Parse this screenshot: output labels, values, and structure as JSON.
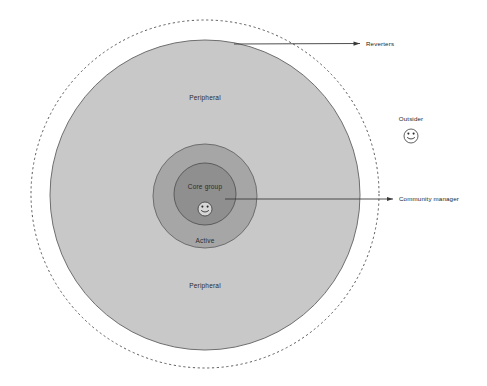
{
  "diagram": {
    "background_color": "#ffffff",
    "zones": [
      {
        "id": "reverters",
        "name": "Reverters boundary",
        "shape": "dashed-circle",
        "fill": "#ffffff",
        "stroke": "#4a4a4a",
        "label": "Reverters",
        "cx": 205,
        "cy": 194,
        "r": 174
      },
      {
        "id": "peripheral",
        "name": "Peripheral ring",
        "shape": "circle",
        "fill": "#c8c8c8",
        "stroke": "#6e6e6e",
        "label_top": "Peripheral",
        "label_bottom": "Peripheral",
        "cx": 205,
        "cy": 195,
        "r": 155
      },
      {
        "id": "active",
        "name": "Active ring",
        "shape": "circle",
        "fill": "#a6a6a6",
        "stroke": "#6e6e6e",
        "label": "Active",
        "cx": 205,
        "cy": 196,
        "r": 52
      },
      {
        "id": "core-group",
        "name": "Core group",
        "shape": "circle",
        "fill": "#8f8f8f",
        "stroke": "#5c5c5c",
        "label": "Core group",
        "cx": 205,
        "cy": 194,
        "r": 31
      }
    ],
    "labels": {
      "peripheral_top": "Peripheral",
      "peripheral_bottom": "Peripheral",
      "active": "Active",
      "core_group": "Core group",
      "reverters": "Reverters",
      "community_manager": "Community manager",
      "outsider": "Outsider"
    },
    "callouts": [
      {
        "id": "reverters-callout",
        "label": "Reverters",
        "arrow_from_x": 360,
        "arrow_from_y": 43,
        "arrow_to_x": 233,
        "arrow_to_y": 44,
        "label_x": 366,
        "label_y": 45,
        "color": "#3a3a3a"
      },
      {
        "id": "community-manager-callout",
        "label": "Community manager",
        "arrow_from_x": 393,
        "arrow_from_y": 199,
        "arrow_to_x": 224,
        "arrow_to_y": 199,
        "label_x": 399,
        "label_y": 201,
        "color": "#3a3a3a"
      }
    ],
    "avatars": [
      {
        "id": "community-manager-avatar",
        "name": "smiley-face-icon",
        "cx": 205,
        "cy": 209,
        "r": 7,
        "context": "core-group"
      },
      {
        "id": "outsider-avatar",
        "name": "smiley-face-icon",
        "cx": 411,
        "cy": 136,
        "r": 7,
        "context": "outside"
      }
    ],
    "outsider": {
      "label": "Outsider",
      "label_x": 411,
      "label_y": 119
    }
  }
}
